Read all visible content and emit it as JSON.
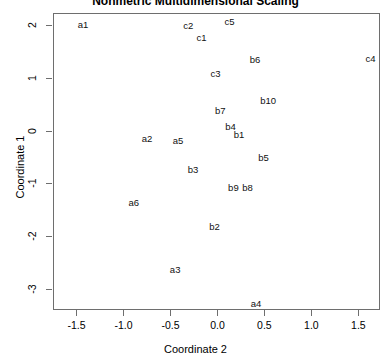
{
  "chart_data": {
    "type": "scatter",
    "title": "Nonmetric Multidimensional Scaling",
    "xlabel": "Coordinate 2",
    "ylabel": "Coordinate 1",
    "xlim": [
      -1.75,
      1.73
    ],
    "ylim": [
      -3.4,
      2.23
    ],
    "xticks": [
      -1.5,
      -1.0,
      -0.5,
      0.0,
      0.5,
      1.0,
      1.5
    ],
    "xtick_labels": [
      "-1.5",
      "-1.0",
      "-0.5",
      "0.0",
      "0.5",
      "1.0",
      "1.5"
    ],
    "yticks": [
      2,
      1,
      0,
      -1,
      -2,
      -3
    ],
    "ytick_labels": [
      "2",
      "1",
      "0",
      "-1",
      "-2",
      "-3"
    ],
    "grid": false,
    "legend": null,
    "marker_style": "text-label",
    "points": [
      {
        "label": "a1",
        "x": -1.43,
        "y": 2.0
      },
      {
        "label": "c2",
        "x": -0.31,
        "y": 1.98
      },
      {
        "label": "c5",
        "x": 0.13,
        "y": 2.06
      },
      {
        "label": "c1",
        "x": -0.17,
        "y": 1.75
      },
      {
        "label": "b6",
        "x": 0.4,
        "y": 1.33
      },
      {
        "label": "c4",
        "x": 1.63,
        "y": 1.35
      },
      {
        "label": "c3",
        "x": -0.02,
        "y": 1.08
      },
      {
        "label": "b10",
        "x": 0.54,
        "y": 0.56
      },
      {
        "label": "b7",
        "x": 0.03,
        "y": 0.38
      },
      {
        "label": "b4",
        "x": 0.14,
        "y": 0.06
      },
      {
        "label": "b1",
        "x": 0.23,
        "y": -0.08
      },
      {
        "label": "a2",
        "x": -0.75,
        "y": -0.15
      },
      {
        "label": "a5",
        "x": -0.42,
        "y": -0.19
      },
      {
        "label": "b5",
        "x": 0.49,
        "y": -0.52
      },
      {
        "label": "b3",
        "x": -0.26,
        "y": -0.75
      },
      {
        "label": "b9",
        "x": 0.17,
        "y": -1.08
      },
      {
        "label": "b8",
        "x": 0.32,
        "y": -1.08
      },
      {
        "label": "a6",
        "x": -0.89,
        "y": -1.38
      },
      {
        "label": "b2",
        "x": -0.03,
        "y": -1.83
      },
      {
        "label": "a3",
        "x": -0.45,
        "y": -2.65
      },
      {
        "label": "a4",
        "x": 0.41,
        "y": -3.29
      }
    ]
  },
  "axes": {
    "y_axis_title": "Coordinate 1",
    "x_axis_title": "Coordinate 2"
  }
}
